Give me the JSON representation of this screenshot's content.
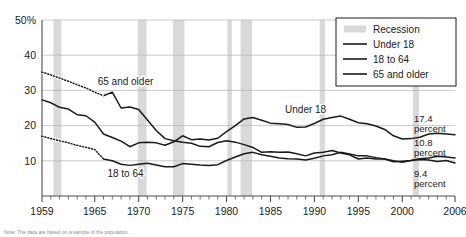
{
  "chart_data": {
    "type": "line",
    "title": "",
    "xlabel": "",
    "ylabel": "",
    "xlim": [
      1959,
      2006
    ],
    "ylim": [
      0,
      50
    ],
    "grid": true,
    "y_ticks": [
      10,
      20,
      30,
      40,
      50
    ],
    "y_tick_labels": [
      "10",
      "20",
      "30",
      "40",
      "50%"
    ],
    "x_ticks": [
      1959,
      1965,
      1970,
      1975,
      1980,
      1985,
      1990,
      1995,
      2000,
      2006
    ],
    "x_tick_labels": [
      "1959",
      "1965",
      "1970",
      "1975",
      "1980",
      "1985",
      "1990",
      "1995",
      "2000",
      "2006"
    ],
    "x_minor_tick_step": 1,
    "legend_position": "top-right",
    "series": [
      {
        "name": "Under 18",
        "color": "#1a1a1a",
        "x": [
          1959,
          1960,
          1961,
          1962,
          1963,
          1964,
          1965,
          1966,
          1967,
          1968,
          1969,
          1970,
          1971,
          1972,
          1973,
          1974,
          1975,
          1976,
          1977,
          1978,
          1979,
          1980,
          1981,
          1982,
          1983,
          1984,
          1985,
          1986,
          1987,
          1988,
          1989,
          1990,
          1991,
          1992,
          1993,
          1994,
          1995,
          1996,
          1997,
          1998,
          1999,
          2000,
          2001,
          2002,
          2003,
          2004,
          2005,
          2006
        ],
        "values": [
          27.3,
          26.5,
          25.2,
          24.7,
          23.1,
          22.8,
          21.0,
          17.6,
          16.6,
          15.6,
          14.0,
          15.1,
          15.3,
          15.1,
          14.4,
          15.4,
          17.1,
          16.0,
          16.2,
          15.9,
          16.4,
          18.3,
          20.0,
          21.9,
          22.3,
          21.5,
          20.7,
          20.5,
          20.3,
          19.5,
          19.6,
          20.6,
          21.8,
          22.3,
          22.7,
          21.8,
          20.8,
          20.5,
          19.9,
          18.9,
          17.1,
          16.2,
          16.3,
          16.7,
          17.6,
          17.8,
          17.6,
          17.4
        ],
        "dashed_segment": null
      },
      {
        "name": "18 to 64",
        "color": "#1a1a1a",
        "x": [
          1959,
          1960,
          1961,
          1962,
          1963,
          1964,
          1965,
          1966,
          1967,
          1968,
          1969,
          1970,
          1971,
          1972,
          1973,
          1974,
          1975,
          1976,
          1977,
          1978,
          1979,
          1980,
          1981,
          1982,
          1983,
          1984,
          1985,
          1986,
          1987,
          1988,
          1989,
          1990,
          1991,
          1992,
          1993,
          1994,
          1995,
          1996,
          1997,
          1998,
          1999,
          2000,
          2001,
          2002,
          2003,
          2004,
          2005,
          2006
        ],
        "values": [
          17.0,
          16.3,
          15.7,
          15.1,
          14.4,
          13.8,
          13.2,
          10.5,
          10.0,
          9.0,
          8.7,
          9.0,
          9.3,
          8.8,
          8.3,
          8.3,
          9.2,
          9.0,
          8.8,
          8.7,
          8.9,
          10.1,
          11.1,
          12.0,
          12.4,
          11.7,
          11.3,
          10.8,
          10.6,
          10.5,
          10.2,
          10.7,
          11.4,
          11.7,
          12.4,
          11.9,
          11.4,
          11.4,
          10.9,
          10.5,
          10.0,
          9.6,
          10.1,
          10.6,
          10.8,
          11.3,
          11.1,
          10.8
        ],
        "dashed_segment": {
          "x": [
            1959,
            1960,
            1961,
            1962,
            1963,
            1964,
            1965,
            1966
          ],
          "values": [
            17.0,
            16.3,
            15.7,
            15.1,
            14.4,
            13.8,
            13.2,
            10.5
          ],
          "style": "dotted",
          "note": "estimated"
        }
      },
      {
        "name": "65 and older",
        "color": "#1a1a1a",
        "x": [
          1959,
          1960,
          1961,
          1962,
          1963,
          1964,
          1965,
          1966,
          1967,
          1968,
          1969,
          1970,
          1971,
          1972,
          1973,
          1974,
          1975,
          1976,
          1977,
          1978,
          1979,
          1980,
          1981,
          1982,
          1983,
          1984,
          1985,
          1986,
          1987,
          1988,
          1989,
          1990,
          1991,
          1992,
          1993,
          1994,
          1995,
          1996,
          1997,
          1998,
          1999,
          2000,
          2001,
          2002,
          2003,
          2004,
          2005,
          2006
        ],
        "values": [
          35.2,
          34.4,
          33.5,
          32.6,
          31.6,
          30.7,
          29.5,
          28.5,
          29.5,
          25.0,
          25.3,
          24.6,
          21.6,
          18.6,
          16.3,
          15.7,
          15.3,
          15.0,
          14.1,
          14.0,
          15.2,
          15.7,
          15.3,
          14.6,
          13.8,
          12.4,
          12.6,
          12.4,
          12.5,
          12.0,
          11.4,
          12.2,
          12.4,
          12.9,
          12.2,
          11.7,
          10.5,
          10.8,
          10.5,
          10.5,
          9.7,
          9.9,
          10.1,
          10.4,
          10.2,
          9.8,
          10.1,
          9.4
        ],
        "dashed_segment": {
          "x": [
            1959,
            1960,
            1961,
            1962,
            1963,
            1964,
            1965,
            1966
          ],
          "values": [
            35.2,
            34.4,
            33.5,
            32.6,
            31.6,
            30.7,
            29.5,
            28.5
          ],
          "style": "dotted",
          "note": "estimated"
        }
      }
    ],
    "recessions": [
      {
        "start": 1960.3,
        "end": 1961.2
      },
      {
        "start": 1969.9,
        "end": 1970.9
      },
      {
        "start": 1973.9,
        "end": 1975.2
      },
      {
        "start": 1980.1,
        "end": 1980.6
      },
      {
        "start": 1981.6,
        "end": 1982.9
      },
      {
        "start": 1990.6,
        "end": 1991.2
      },
      {
        "start": 2001.2,
        "end": 2001.9
      }
    ],
    "annotations": [
      {
        "text": "65 and older",
        "x": 1968.5,
        "y": 31.5,
        "name": "series-label-65-and-older"
      },
      {
        "text": "Under 18",
        "x": 1989.0,
        "y": 23.5,
        "name": "series-label-under-18"
      },
      {
        "text": "18 to 64",
        "x": 1968.5,
        "y": 5.5,
        "name": "series-label-18-to-64"
      }
    ],
    "end_labels": [
      {
        "value": "17.4",
        "unit": "percent",
        "series": "Under 18"
      },
      {
        "value": "10.8",
        "unit": "percent",
        "series": "18 to 64"
      },
      {
        "value": "9.4",
        "unit": "percent",
        "series": "65 and older"
      }
    ]
  },
  "legend": {
    "entries": [
      {
        "label": "Recession",
        "type": "swatch",
        "color": "#d9d9d9"
      },
      {
        "label": "Under 18",
        "type": "line",
        "color": "#1a1a1a"
      },
      {
        "label": "18 to 64",
        "type": "line",
        "color": "#1a1a1a"
      },
      {
        "label": "65 and older",
        "type": "line",
        "color": "#1a1a1a"
      }
    ]
  },
  "colors": {
    "recession_band": "#d9d9d9",
    "grid": "#b3b3b3",
    "axis": "#4d4d4d",
    "line": "#1a1a1a",
    "legend_border": "#1a1a1a"
  },
  "footnote": {
    "text": "Note: The data are based on a sample of the population."
  }
}
